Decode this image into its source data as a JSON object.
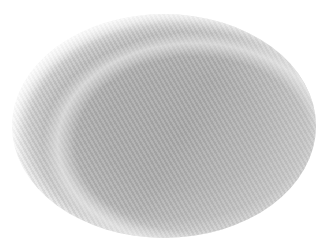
{
  "image": {
    "subject": "gray oval mesh disc",
    "background_color": "#ffffff",
    "disc": {
      "center": [
        164,
        126
      ],
      "radius": [
        152,
        112
      ],
      "fill_color": "#aaaaaa",
      "rim_color": "#e8e8e8",
      "texture": "diagonal striations"
    }
  }
}
